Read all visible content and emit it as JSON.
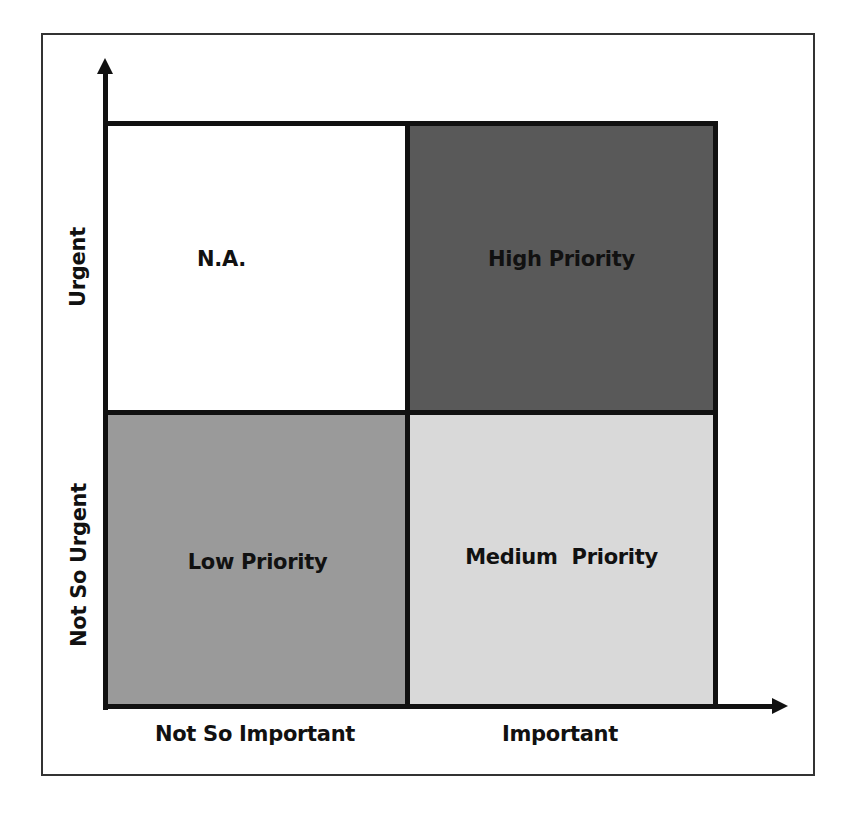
{
  "diagram": {
    "type": "priority-matrix",
    "axes": {
      "y": {
        "direction": "up",
        "labels": [
          "Urgent",
          "Not So Urgent"
        ]
      },
      "x": {
        "direction": "right",
        "labels": [
          "Not So Important",
          "Important"
        ]
      }
    },
    "quadrants": [
      {
        "position": "top-left",
        "label": "N.A.",
        "fill": "#ffffff"
      },
      {
        "position": "top-right",
        "label": "High Priority",
        "fill": "#595959"
      },
      {
        "position": "bottom-left",
        "label": "Low Priority",
        "fill": "#9a9a9a"
      },
      {
        "position": "bottom-right",
        "label": "Medium  Priority",
        "fill": "#d9d9d9"
      }
    ],
    "colors": {
      "border": "#111111",
      "frame": "#333333",
      "background": "#ffffff"
    }
  }
}
